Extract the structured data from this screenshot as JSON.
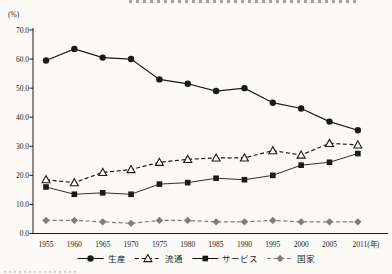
{
  "page": {
    "background_color": "#fbfaf7",
    "note": "scanned-book style line chart; chart title clipped at top edge, source note clipped at bottom-left edge"
  },
  "chart_data": {
    "type": "line",
    "unit_label": "(%)",
    "x_suffix": "(年)",
    "categories": [
      "1955",
      "1960",
      "1965",
      "1970",
      "1975",
      "1980",
      "1985",
      "1990",
      "1995",
      "2000",
      "2005",
      "2011"
    ],
    "ylim": [
      0,
      70
    ],
    "ytick_step": 10,
    "ytick_labels": [
      "0.0",
      "10.0",
      "20.0",
      "30.0",
      "40.0",
      "50.0",
      "60.0",
      "70.0"
    ],
    "grid": false,
    "legend_position": "bottom",
    "axis_color": "#1c1c1c",
    "series": [
      {
        "name": "生産",
        "key": "production",
        "marker": "circle",
        "line": "solid",
        "color": "#1a1a1a",
        "values": [
          59.5,
          63.5,
          60.5,
          60.0,
          53.0,
          51.5,
          49.0,
          50.0,
          45.0,
          43.0,
          38.5,
          35.5
        ]
      },
      {
        "name": "流通",
        "key": "distribution",
        "marker": "triangle-open",
        "line": "dashed",
        "color": "#1a1a1a",
        "values": [
          18.5,
          17.5,
          21.0,
          22.0,
          24.5,
          25.5,
          26.0,
          26.0,
          28.5,
          27.0,
          31.0,
          30.5
        ]
      },
      {
        "name": "サービス",
        "key": "service",
        "marker": "square",
        "line": "solid",
        "color": "#1a1a1a",
        "values": [
          16.0,
          13.5,
          14.0,
          13.5,
          17.0,
          17.5,
          19.0,
          18.5,
          20.0,
          23.5,
          24.5,
          27.5
        ]
      },
      {
        "name": "国家",
        "key": "state",
        "marker": "diamond",
        "line": "dashed",
        "color": "#7d7d7d",
        "values": [
          4.5,
          4.5,
          4.0,
          3.5,
          4.5,
          4.5,
          4.0,
          4.0,
          4.5,
          4.0,
          4.0,
          4.0
        ]
      }
    ]
  }
}
